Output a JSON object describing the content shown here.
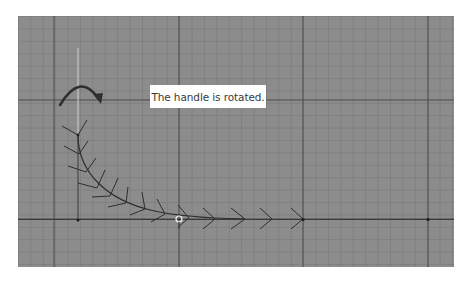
{
  "diagram": {
    "caption": "The handle is rotated.",
    "colors": {
      "page_background": "#ffffff",
      "grid_background": "#8c8c8c",
      "grid_minor_line": "#6f6f6f",
      "grid_major_line": "#4a4a4a",
      "curve": "#2e2e2e",
      "handle_line": "#c8c8c8",
      "caption_background": "#ffffff",
      "caption_text": "#3a3a3a"
    },
    "elements": {
      "rotation_arrow": "curved-clockwise-arrow",
      "handle": "rotated-handle-line",
      "curve": "chevron-stroke-path",
      "anchor_points": [
        "start-point",
        "handle-point",
        "end-point",
        "far-point"
      ]
    }
  }
}
